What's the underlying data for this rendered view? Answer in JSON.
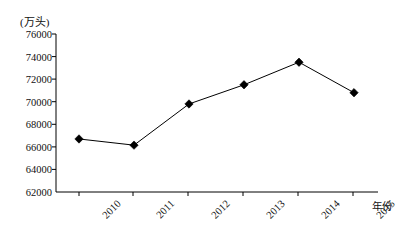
{
  "chart_data": {
    "type": "line",
    "title": "",
    "unit_label": "(万头)",
    "xlabel": "年份",
    "ylabel": "",
    "categories": [
      "2010",
      "2011",
      "2012",
      "2013",
      "2014",
      "2015"
    ],
    "values": [
      66700,
      66150,
      69800,
      71500,
      73500,
      70800
    ],
    "series": [
      {
        "name": "",
        "values": [
          66700,
          66150,
          69800,
          71500,
          73500,
          70800
        ]
      }
    ],
    "ylim": [
      62000,
      76000
    ],
    "ytick_labels": [
      "76000",
      "74000",
      "72000",
      "70000",
      "68000",
      "66000",
      "64000",
      "62000"
    ],
    "ytick_values": [
      76000,
      74000,
      72000,
      70000,
      68000,
      66000,
      64000,
      62000
    ],
    "grid": false,
    "legend": "none",
    "marker": "diamond",
    "marker_color": "#000000",
    "line_color": "#000000",
    "axis_color": "#000000"
  }
}
